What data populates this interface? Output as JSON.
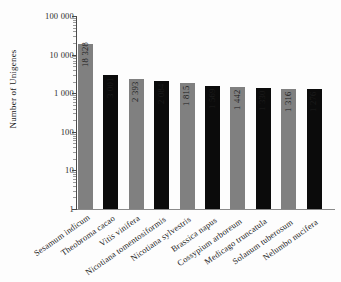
{
  "chart_data": {
    "type": "bar",
    "title": "",
    "xlabel": "",
    "ylabel": "Number of Unigenes",
    "scale": "log",
    "ylim": [
      1,
      100000
    ],
    "grid": false,
    "legend": "none",
    "ytick_labels": [
      "100 000",
      "10 000",
      "1 000",
      "100",
      "10",
      "1"
    ],
    "ytick_values": [
      100000,
      10000,
      1000,
      100,
      10,
      1
    ],
    "categories": [
      "Sesamum indicum",
      "Theobroma cacao",
      "Vitis vinifera",
      "Nicotiana tomentosiformis",
      "Nicotiana sylvestris",
      "Brassica napus",
      "Cossypium arboreum",
      "Medicago truncatula",
      "Solanum tuberosum",
      "Nelumbo nucifera"
    ],
    "values": [
      18328,
      3001,
      2393,
      2084,
      1815,
      1569,
      1442,
      1330,
      1316,
      1276
    ],
    "value_labels": [
      "18 328",
      "3 001",
      "2 393",
      "2 084",
      "1 815",
      "1 569",
      "1 442",
      "1 330",
      "1 316",
      "1 276"
    ],
    "bar_colors": [
      "#808080",
      "#0b0b0b",
      "#808080",
      "#0b0b0b",
      "#808080",
      "#0b0b0b",
      "#808080",
      "#0b0b0b",
      "#808080",
      "#0b0b0b"
    ],
    "colors": {
      "gray": "#808080",
      "black": "#0b0b0b",
      "axis": "#4a4a4a",
      "background": "#fdfdfd"
    }
  }
}
